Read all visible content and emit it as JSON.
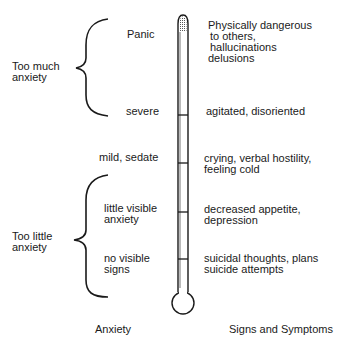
{
  "diagram": {
    "type": "anxiety-thermometer",
    "groups": [
      {
        "label_line1": "Too much",
        "label_line2": "anxiety"
      },
      {
        "label_line1": "Too little",
        "label_line2": "anxiety"
      }
    ],
    "levels": [
      {
        "level": "Panic",
        "signs": [
          "Physically dangerous",
          "to others,",
          "hallucinations",
          "delusions"
        ]
      },
      {
        "level": "severe",
        "signs": [
          "agitated, disoriented"
        ]
      },
      {
        "level": "mild, sedate",
        "signs": [
          "crying, verbal hostility,",
          "feeling  cold"
        ]
      },
      {
        "level_line1": "little visible",
        "level_line2": "anxiety",
        "signs": [
          "decreased appetite,",
          "depression"
        ]
      },
      {
        "level_line1": "no visible",
        "level_line2": "signs",
        "signs": [
          "suicidal thoughts, plans",
          "suicide attempts"
        ]
      }
    ],
    "axis_labels": {
      "left": "Anxiety",
      "right": "Signs and Symptoms"
    }
  }
}
